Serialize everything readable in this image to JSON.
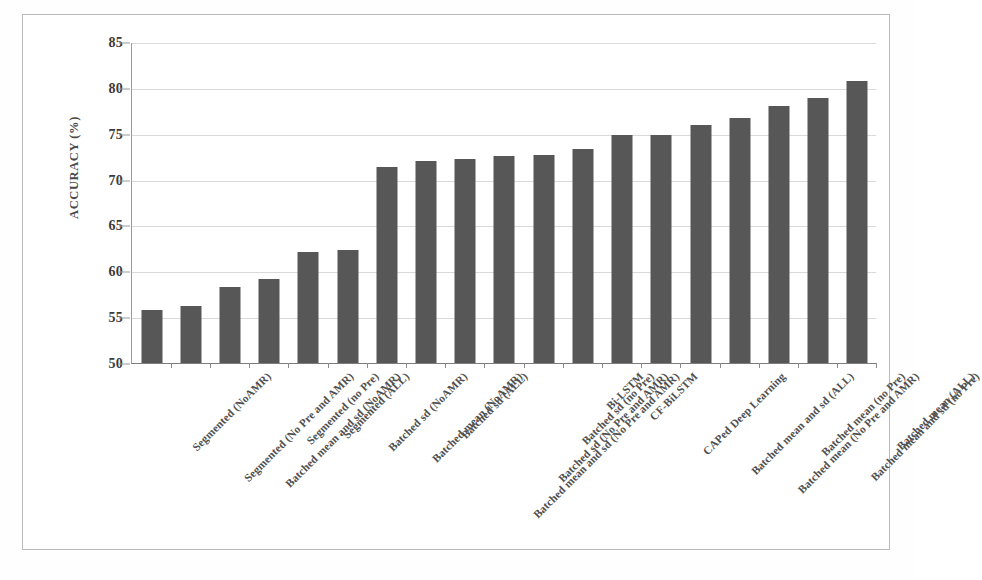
{
  "figure": {
    "background_color": "#ffffff",
    "bar_color": "#575757",
    "grid_color": "#d9d9d9",
    "axis_color": "#7d7d7d"
  },
  "chart_data": {
    "type": "bar",
    "title": "",
    "xlabel": "",
    "ylabel": "ACCURACY (%)",
    "ylim": [
      50,
      85
    ],
    "yticks": [
      50,
      55,
      60,
      65,
      70,
      75,
      80,
      85
    ],
    "ytick_labels": [
      "50",
      "55",
      "60",
      "65",
      "70",
      "75",
      "80",
      "85"
    ],
    "grid": true,
    "legend": "none",
    "categories": [
      "Segmented (NoAMR)",
      "Segmented (No Pre and AMR)",
      "Batched mean and sd (NoAMR)",
      "Segmented (no Pre)",
      "Segmented (ALL)",
      "Batched sd (NoAMR)",
      "Batched mean (NoAMR)",
      "Batched sd (ALL)",
      "Batched mean and sd (No Pre and AMR)",
      "Batched sd (No Pre and AMR)",
      "Batched sd (no Pre)",
      "Bi-LSTM",
      "CF-BiLSTM",
      "CAPed Deep Learning",
      "Batched mean and sd (ALL)",
      "Batched mean (No Pre and AMR)",
      "Batched mean (no Pre)",
      "Batched mean and sd (no Pre)",
      "Batched mean (ALL)"
    ],
    "values": [
      55.8,
      56.2,
      58.3,
      59.2,
      62.1,
      62.3,
      71.4,
      72.0,
      72.2,
      72.6,
      72.7,
      73.3,
      74.9,
      74.9,
      76.0,
      76.7,
      78.0,
      78.9,
      80.7
    ]
  }
}
